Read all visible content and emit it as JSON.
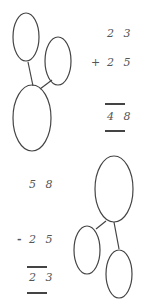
{
  "addition": {
    "addend1": "2 3",
    "operator": "+",
    "addend2": "2 5",
    "sum": "4 8"
  },
  "subtraction": {
    "minuend": "5 8",
    "operator": "-",
    "subtrahend": "2 5",
    "difference": "2 3"
  },
  "colors": {
    "stroke": "#444444",
    "text": "#555555"
  }
}
